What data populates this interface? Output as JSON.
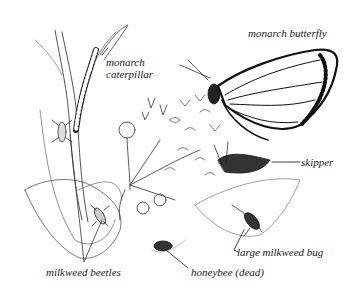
{
  "illustration": {
    "subject": "milkweed plant with visiting insects",
    "ink_color": "#1a1a1a",
    "background": "#ffffff"
  },
  "labels": {
    "monarch_butterfly": "monarch butterfly",
    "monarch_caterpillar_line1": "monarch",
    "monarch_caterpillar_line2": "caterpillar",
    "skipper": "skipper",
    "large_milkweed_bug": "large milkweed bug",
    "honeybee": "honeybee (dead)",
    "milkweed_beetles": "milkweed beetles"
  }
}
